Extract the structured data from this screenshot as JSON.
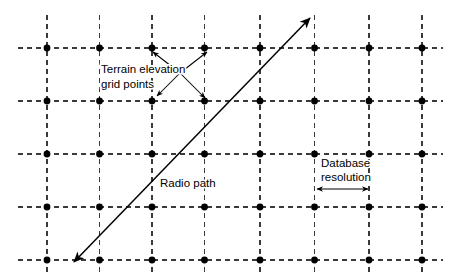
{
  "figure": {
    "type": "terrain-grid-radio-path-diagram",
    "width": 460,
    "height": 277,
    "background_color": "#ffffff"
  },
  "grid": {
    "columns": 8,
    "rows": 5,
    "column_x": [
      47,
      99.5,
      152,
      204.5,
      260,
      314.5,
      369,
      422
    ],
    "row_y": [
      48,
      101,
      154,
      207,
      260
    ],
    "spacing_x": 52.5,
    "spacing_y": 53,
    "line_color": "#3a3a3a",
    "line_style": "dashed",
    "dash_pattern": "5 4",
    "dot_color": "#000000",
    "dot_radius": 3.4,
    "horizontal_extent": [
      18,
      443
    ],
    "vertical_extent": [
      15,
      272
    ]
  },
  "radio_path": {
    "label": "Radio path",
    "label_x": 160,
    "label_y": 187,
    "start": [
      74,
      262
    ],
    "end": [
      310,
      18
    ],
    "double_headed": true,
    "color": "#000000"
  },
  "terrain_label": {
    "line1": "Terrain elevation",
    "line2": "grid points",
    "line1_x": 101,
    "line1_y": 73,
    "line2_x": 101,
    "line2_y": 88,
    "pointers": [
      {
        "from": [
          180,
          73
        ],
        "to": [
          207,
          52
        ]
      },
      {
        "from": [
          180,
          73
        ],
        "to": [
          153,
          52
        ]
      },
      {
        "from": [
          180,
          73
        ],
        "to": [
          157,
          96
        ]
      },
      {
        "from": [
          180,
          73
        ],
        "to": [
          205,
          98
        ]
      }
    ]
  },
  "database_resolution": {
    "line1": "Database",
    "line2": "resolution",
    "line1_x": 321,
    "line1_y": 167,
    "line2_x": 321,
    "line2_y": 181,
    "arrow_y": 189,
    "arrow_start_x": 317,
    "arrow_end_x": 368,
    "double_headed": true
  }
}
